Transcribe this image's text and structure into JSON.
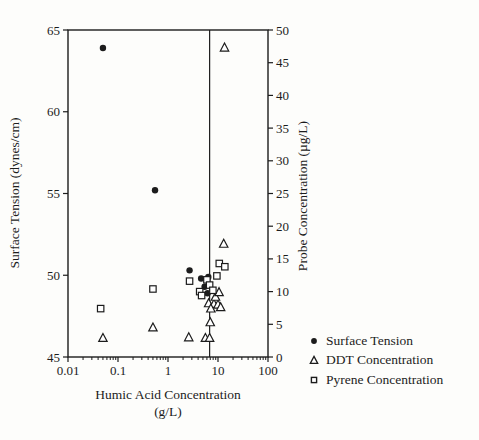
{
  "figure": {
    "background": "#fdfdfb",
    "ink": "#1c1c1c"
  },
  "axes": {
    "x": {
      "title_line1": "Humic Acid Concentration",
      "title_line2": "(g/L)",
      "scale": "log",
      "min": 0.01,
      "max": 100,
      "tick_labels": [
        "0.01",
        "0.1",
        "1",
        "10",
        "100"
      ],
      "tick_values": [
        0.01,
        0.1,
        1,
        10,
        100
      ]
    },
    "y_left": {
      "title": "Surface Tension (dynes/cm)",
      "min": 45,
      "max": 65,
      "tick_labels": [
        "45",
        "50",
        "55",
        "60",
        "65"
      ],
      "tick_values": [
        45,
        50,
        55,
        60,
        65
      ]
    },
    "y_right": {
      "title": "Probe Concentration (µg/L)",
      "min": 0,
      "max": 50,
      "tick_labels": [
        "0",
        "5",
        "10",
        "15",
        "20",
        "25",
        "30",
        "35",
        "40",
        "45",
        "50"
      ],
      "tick_values": [
        0,
        5,
        10,
        15,
        20,
        25,
        30,
        35,
        40,
        45,
        50
      ]
    }
  },
  "legend": {
    "items": [
      {
        "label": "Surface Tension",
        "marker": "filled-circle"
      },
      {
        "label": "DDT Concentration",
        "marker": "open-triangle"
      },
      {
        "label": "Pyrene Concentration",
        "marker": "open-square"
      }
    ]
  },
  "chart_data": {
    "type": "scatter",
    "title": "",
    "xlabel": "Humic Acid Concentration (g/L)",
    "x_scale": "log",
    "xlim": [
      0.01,
      100
    ],
    "ylabel_left": "Surface Tension (dynes/cm)",
    "ylim_left": [
      45,
      65
    ],
    "ylabel_right": "Probe Concentration (µg/L)",
    "ylim_right": [
      0,
      50
    ],
    "vline_x": 6.8,
    "grid": false,
    "legend_position": "outside-right-bottom",
    "series": [
      {
        "name": "Surface Tension",
        "axis": "left",
        "marker": "filled-circle",
        "points": [
          [
            0.05,
            63.9
          ],
          [
            0.55,
            55.2
          ],
          [
            2.7,
            50.3
          ],
          [
            4.6,
            49.8
          ],
          [
            6.4,
            49.9
          ],
          [
            5.4,
            49.3
          ],
          [
            6.2,
            48.9
          ]
        ]
      },
      {
        "name": "DDT Concentration",
        "axis": "right",
        "marker": "open-triangle",
        "points": [
          [
            0.05,
            2.9
          ],
          [
            0.5,
            4.5
          ],
          [
            2.6,
            3.0
          ],
          [
            5.6,
            2.9
          ],
          [
            6.8,
            2.9
          ],
          [
            7.0,
            5.3
          ],
          [
            6.5,
            8.2
          ],
          [
            8.3,
            8.1
          ],
          [
            10.0,
            8.0
          ],
          [
            11.3,
            7.6
          ],
          [
            7.2,
            7.4
          ],
          [
            8.9,
            9.2
          ],
          [
            10.5,
            9.9
          ],
          [
            13.0,
            17.3
          ],
          [
            13.5,
            47.3
          ]
        ]
      },
      {
        "name": "Pyrene Concentration",
        "axis": "right",
        "marker": "open-square",
        "points": [
          [
            0.045,
            7.4
          ],
          [
            0.5,
            10.4
          ],
          [
            2.7,
            11.6
          ],
          [
            4.3,
            10.0
          ],
          [
            4.7,
            9.4
          ],
          [
            6.0,
            11.8
          ],
          [
            6.8,
            11.0
          ],
          [
            7.9,
            10.2
          ],
          [
            9.5,
            12.4
          ],
          [
            10.6,
            14.3
          ],
          [
            13.7,
            13.8
          ]
        ]
      }
    ]
  }
}
